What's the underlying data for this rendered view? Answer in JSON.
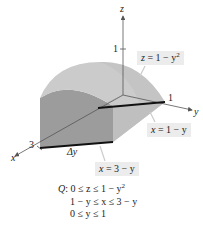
{
  "figure": {
    "axes": {
      "z_label": "z",
      "y_label": "y",
      "x_label": "x",
      "z_tick": "1",
      "y_tick": "1",
      "x_tick": "3"
    },
    "surface_labels": {
      "top_surface": {
        "lhs": "z",
        "eq": " = 1 − y",
        "exp": "2"
      },
      "back_plane": {
        "lhs": "x",
        "eq": " =  1 − y"
      },
      "front_plane": {
        "lhs": "x",
        "eq": " = 3 − y"
      }
    },
    "delta_label": "Δy",
    "region": {
      "name": "Q",
      "conditions": [
        {
          "text": "0 ≤ z ≤ 1 − y",
          "exp": "2"
        },
        {
          "text": "1 − y ≤ x ≤ 3 − y",
          "exp": ""
        },
        {
          "text": "0 ≤ y ≤ 1",
          "exp": ""
        }
      ]
    },
    "colors": {
      "top_surface": "#c9c9c9",
      "front_face": "#9a9a9a",
      "side_face": "#b8b8b8",
      "bottom_face": "#d6d6d6",
      "label_box": "#ececec",
      "axis": "#555555",
      "thick_line": "#111111"
    }
  }
}
